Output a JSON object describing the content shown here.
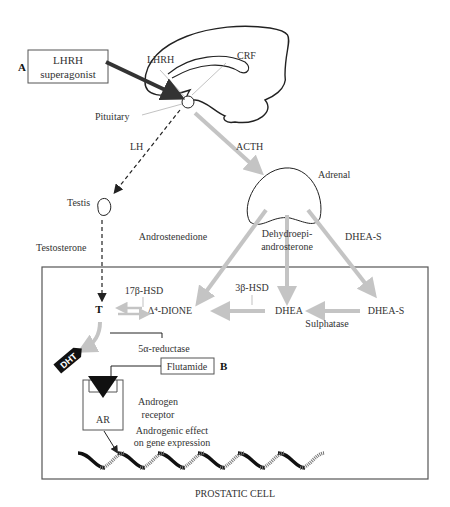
{
  "diagram": {
    "title": "PROSTATIC CELL",
    "markers": {
      "a": "A",
      "b": "B"
    },
    "boxes": {
      "lhrh_superagonist": [
        "LHRH",
        "superagonist"
      ],
      "flutamide": "Flutamide",
      "ar": "AR"
    },
    "brain_labels": {
      "lhrh": "LHRH",
      "crf": "CRF",
      "pituitary": "Pituitary"
    },
    "hormones": {
      "lh": "LH",
      "acth": "ACTH",
      "testis": "Testis",
      "testosterone": "Testosterone",
      "adrenal": "Adrenal",
      "androstenedione": "Androstenedione",
      "dhea_full": [
        "Dehydroepi-",
        "androsterone"
      ],
      "dhea_s_top": "DHEA-S"
    },
    "cell": {
      "t": "T",
      "dione": "Δ⁴-DIONE",
      "dhea": "DHEA",
      "dhea_s": "DHEA-S",
      "hsd17": "17β-HSD",
      "hsd3": "3β-HSD",
      "sulphatase": "Sulphatase",
      "reductase": "5α-reductase",
      "dht": "DHT",
      "receptor": [
        "Androgen",
        "receptor"
      ],
      "effect": [
        "Androgenic effect",
        "on gene expression"
      ]
    },
    "colors": {
      "gray_arrow": "#c4c4c4",
      "line": "#222222",
      "box_border": "#555555"
    }
  }
}
